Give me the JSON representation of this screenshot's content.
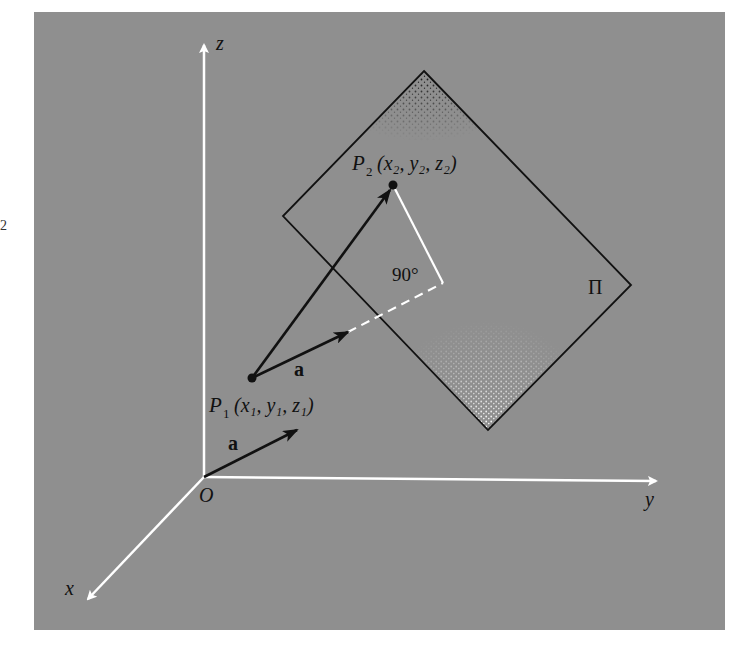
{
  "figure": {
    "background_color": "#8f8f8f",
    "panel": {
      "x": 34,
      "y": 12,
      "width": 691,
      "height": 618
    },
    "axis_color": "#ffffff",
    "ink_color": "#111111"
  },
  "axes": {
    "origin": {
      "label": "O",
      "x": 204,
      "y": 477
    },
    "z": {
      "label": "z",
      "tip": [
        204,
        43
      ]
    },
    "y": {
      "label": "y",
      "tip": [
        658,
        481
      ]
    },
    "x": {
      "label": "x",
      "tip": [
        86,
        601
      ]
    }
  },
  "plane": {
    "label": "Π",
    "vertices": {
      "top": [
        424,
        71
      ],
      "right": [
        631,
        285
      ],
      "bottom": [
        488,
        430
      ],
      "left": [
        283,
        216
      ]
    }
  },
  "points": {
    "p1": {
      "name": "P",
      "sub": "1",
      "coords_label": "(x₁, y₁, z₁)",
      "x": 252,
      "y": 378
    },
    "p2": {
      "name": "P",
      "sub": "2",
      "coords_label": "(x₂, y₂, z₂)",
      "x": 393,
      "y": 185
    }
  },
  "vectors": {
    "a_at_origin": {
      "label": "a",
      "from": [
        204,
        477
      ],
      "to": [
        297,
        430
      ]
    },
    "a_at_p1": {
      "label": "a",
      "from": [
        252,
        378
      ],
      "to": [
        348,
        332
      ]
    },
    "p1_to_p2": {
      "from": [
        252,
        378
      ],
      "to": [
        393,
        185
      ]
    }
  },
  "projection": {
    "dashed_from": [
      348,
      332
    ],
    "corner": [
      443,
      283
    ],
    "perpendicular_to": [
      393,
      185
    ],
    "angle_label": "90°"
  },
  "edge_mark": "2"
}
